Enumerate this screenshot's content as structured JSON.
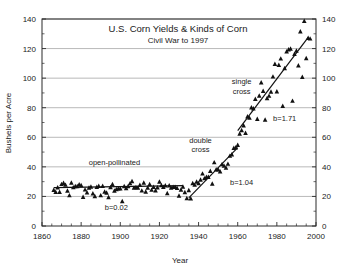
{
  "chart_data": {
    "type": "scatter",
    "title": "U.S. Corn Yields & Kinds of Corn",
    "subtitle": "Civil War to 1997",
    "xlabel": "Year",
    "ylabel": "Bushels per Acre",
    "xlim": [
      1860,
      2000
    ],
    "ylim": [
      0,
      140
    ],
    "xticks": [
      1860,
      1880,
      1900,
      1920,
      1940,
      1960,
      1980,
      2000
    ],
    "yticks": [
      0,
      20,
      40,
      60,
      80,
      100,
      120,
      140
    ],
    "xtick_labels": [
      "1860",
      "1880",
      "1900",
      "1920",
      "1940",
      "1960",
      "1980",
      "2000"
    ],
    "ytick_labels": [
      "0",
      "20",
      "40",
      "60",
      "80",
      "100",
      "120",
      "140"
    ],
    "right_axis": true,
    "right_ytick_labels": [
      "0",
      "20",
      "40",
      "60",
      "80",
      "100",
      "120",
      "140"
    ],
    "xtick_minor_step": 5,
    "grid": true,
    "grid_axis": "y",
    "legend_position": "none",
    "marker": "triangle",
    "marker_color": "#111111",
    "grid_color": "#9a9a9a",
    "frame_color": "#2b2b2b",
    "annotations": [
      {
        "id": "open-pollinated",
        "text": "open-pollinated",
        "x": 1897,
        "y": 41
      },
      {
        "id": "b-open-pollinated",
        "text": "b=0.02",
        "x": 1898,
        "y": 11
      },
      {
        "id": "double-cross",
        "text": "double",
        "x": 1941,
        "y": 56
      },
      {
        "id": "double-cross-2",
        "text": "cross",
        "x": 1941,
        "y": 50
      },
      {
        "id": "b-double-cross",
        "text": "b=1.04",
        "x": 1962,
        "y": 28
      },
      {
        "id": "single-cross",
        "text": "single",
        "x": 1962,
        "y": 96
      },
      {
        "id": "single-cross-2",
        "text": "cross",
        "x": 1962,
        "y": 89
      },
      {
        "id": "b-single-cross",
        "text": "b=1.71",
        "x": 1984,
        "y": 71
      }
    ],
    "trend_segments": [
      {
        "id": "open-pollinated-fit",
        "slope": 0.02,
        "x": [
          1866,
          1932
        ],
        "y": [
          26.0,
          27.3
        ]
      },
      {
        "id": "double-cross-fit",
        "slope": 1.04,
        "x": [
          1935,
          1960
        ],
        "y": [
          19.0,
          53.0
        ]
      },
      {
        "id": "single-cross-fit",
        "slope": 1.71,
        "x": [
          1960,
          1996
        ],
        "y": [
          64.5,
          127.5
        ]
      }
    ],
    "series": [
      {
        "name": "U.S. average corn yield",
        "points": [
          [
            1866,
            24.3
          ],
          [
            1867,
            23.0
          ],
          [
            1868,
            26.0
          ],
          [
            1869,
            23.0
          ],
          [
            1870,
            28.3
          ],
          [
            1871,
            29.0
          ],
          [
            1872,
            27.8
          ],
          [
            1873,
            23.8
          ],
          [
            1874,
            20.7
          ],
          [
            1875,
            29.2
          ],
          [
            1876,
            26.1
          ],
          [
            1877,
            26.9
          ],
          [
            1878,
            26.8
          ],
          [
            1879,
            28.0
          ],
          [
            1880,
            27.6
          ],
          [
            1881,
            19.6
          ],
          [
            1882,
            24.6
          ],
          [
            1883,
            22.7
          ],
          [
            1884,
            25.8
          ],
          [
            1885,
            26.5
          ],
          [
            1886,
            22.0
          ],
          [
            1887,
            20.1
          ],
          [
            1888,
            26.3
          ],
          [
            1889,
            27.0
          ],
          [
            1890,
            20.7
          ],
          [
            1891,
            27.0
          ],
          [
            1892,
            23.1
          ],
          [
            1893,
            22.5
          ],
          [
            1894,
            19.4
          ],
          [
            1895,
            26.2
          ],
          [
            1896,
            28.2
          ],
          [
            1897,
            23.8
          ],
          [
            1898,
            24.8
          ],
          [
            1899,
            25.3
          ],
          [
            1900,
            25.3
          ],
          [
            1901,
            16.7
          ],
          [
            1902,
            26.8
          ],
          [
            1903,
            25.5
          ],
          [
            1904,
            26.8
          ],
          [
            1905,
            28.8
          ],
          [
            1906,
            30.3
          ],
          [
            1907,
            25.9
          ],
          [
            1908,
            26.2
          ],
          [
            1909,
            25.9
          ],
          [
            1910,
            27.7
          ],
          [
            1911,
            23.9
          ],
          [
            1912,
            29.2
          ],
          [
            1913,
            23.1
          ],
          [
            1914,
            25.8
          ],
          [
            1915,
            28.2
          ],
          [
            1916,
            24.4
          ],
          [
            1917,
            26.3
          ],
          [
            1918,
            24.0
          ],
          [
            1919,
            26.0
          ],
          [
            1920,
            29.9
          ],
          [
            1921,
            27.5
          ],
          [
            1922,
            26.3
          ],
          [
            1923,
            27.4
          ],
          [
            1924,
            22.1
          ],
          [
            1925,
            27.4
          ],
          [
            1926,
            25.9
          ],
          [
            1927,
            26.4
          ],
          [
            1928,
            26.3
          ],
          [
            1929,
            25.7
          ],
          [
            1930,
            20.5
          ],
          [
            1931,
            24.5
          ],
          [
            1932,
            26.5
          ],
          [
            1933,
            22.8
          ],
          [
            1934,
            18.7
          ],
          [
            1935,
            24.2
          ],
          [
            1936,
            18.6
          ],
          [
            1937,
            28.9
          ],
          [
            1938,
            27.8
          ],
          [
            1939,
            29.9
          ],
          [
            1940,
            28.9
          ],
          [
            1941,
            31.2
          ],
          [
            1942,
            35.4
          ],
          [
            1943,
            32.2
          ],
          [
            1944,
            33.1
          ],
          [
            1945,
            33.1
          ],
          [
            1946,
            37.2
          ],
          [
            1947,
            28.6
          ],
          [
            1948,
            43.0
          ],
          [
            1949,
            38.2
          ],
          [
            1950,
            38.2
          ],
          [
            1951,
            36.9
          ],
          [
            1952,
            41.8
          ],
          [
            1953,
            40.7
          ],
          [
            1954,
            39.4
          ],
          [
            1955,
            42.0
          ],
          [
            1956,
            47.4
          ],
          [
            1957,
            48.3
          ],
          [
            1958,
            52.8
          ],
          [
            1959,
            53.1
          ],
          [
            1960,
            54.7
          ],
          [
            1961,
            62.4
          ],
          [
            1962,
            64.7
          ],
          [
            1963,
            67.9
          ],
          [
            1964,
            62.9
          ],
          [
            1965,
            74.1
          ],
          [
            1966,
            73.1
          ],
          [
            1967,
            80.1
          ],
          [
            1968,
            79.5
          ],
          [
            1969,
            85.9
          ],
          [
            1970,
            72.4
          ],
          [
            1971,
            88.1
          ],
          [
            1972,
            97.0
          ],
          [
            1973,
            91.3
          ],
          [
            1974,
            71.9
          ],
          [
            1975,
            86.4
          ],
          [
            1976,
            88.0
          ],
          [
            1977,
            90.8
          ],
          [
            1978,
            101.0
          ],
          [
            1979,
            109.5
          ],
          [
            1980,
            91.0
          ],
          [
            1981,
            108.9
          ],
          [
            1982,
            113.2
          ],
          [
            1983,
            81.1
          ],
          [
            1984,
            106.7
          ],
          [
            1985,
            118.0
          ],
          [
            1986,
            119.4
          ],
          [
            1987,
            119.8
          ],
          [
            1988,
            84.6
          ],
          [
            1989,
            116.3
          ],
          [
            1990,
            118.5
          ],
          [
            1991,
            108.6
          ],
          [
            1992,
            131.5
          ],
          [
            1993,
            100.7
          ],
          [
            1994,
            138.6
          ],
          [
            1995,
            113.5
          ],
          [
            1996,
            127.1
          ],
          [
            1997,
            126.7
          ]
        ]
      }
    ]
  }
}
